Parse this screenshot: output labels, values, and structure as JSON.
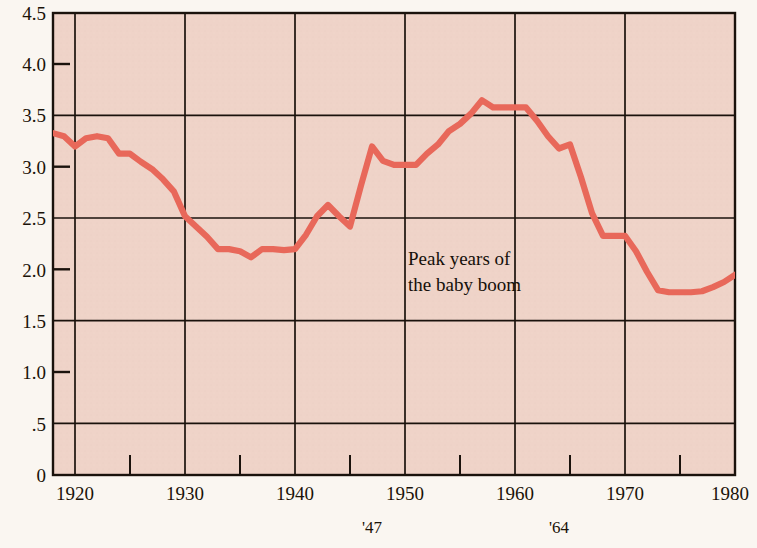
{
  "chart_data": {
    "type": "line",
    "title": "",
    "xlabel": "",
    "ylabel": "",
    "xlim": [
      1918,
      1980
    ],
    "ylim": [
      0,
      4.5
    ],
    "grid": true,
    "legend": null,
    "y_ticks_major": [
      "0",
      ".5",
      "1.0",
      "1.5",
      "2.0",
      "2.5",
      "3.0",
      "3.5",
      "4.0",
      "4.5"
    ],
    "y_tick_values": [
      0,
      0.5,
      1.0,
      1.5,
      2.0,
      2.5,
      3.0,
      3.5,
      4.0,
      4.5
    ],
    "y_gridline_values": [
      0.5,
      1.5,
      2.5,
      3.5,
      4.5
    ],
    "x_ticks_major": [
      "1920",
      "1930",
      "1940",
      "1950",
      "1960",
      "1970",
      "1980"
    ],
    "x_tick_values": [
      1920,
      1930,
      1940,
      1950,
      1960,
      1970,
      1980
    ],
    "x_minor_tick_values": [
      1925,
      1935,
      1945,
      1955,
      1965,
      1975
    ],
    "annotations": [
      {
        "name": "peak-years-note",
        "lines": [
          "Peak years of",
          "the baby boom"
        ],
        "x": 1947.5,
        "y": 2.08
      },
      {
        "name": "x-callout-1947",
        "text": "'47",
        "x": 1947
      },
      {
        "name": "x-callout-1964",
        "text": "'64",
        "x": 1964
      }
    ],
    "series": [
      {
        "name": "Total fertility rate",
        "color": "#e8685a",
        "x": [
          1918,
          1919,
          1920,
          1921,
          1922,
          1923,
          1924,
          1925,
          1926,
          1927,
          1928,
          1929,
          1930,
          1931,
          1932,
          1933,
          1934,
          1935,
          1936,
          1937,
          1938,
          1939,
          1940,
          1941,
          1942,
          1943,
          1944,
          1945,
          1946,
          1947,
          1948,
          1949,
          1950,
          1951,
          1952,
          1953,
          1954,
          1955,
          1956,
          1957,
          1958,
          1959,
          1960,
          1961,
          1962,
          1963,
          1964,
          1965,
          1966,
          1967,
          1968,
          1969,
          1970,
          1971,
          1972,
          1973,
          1974,
          1975,
          1976,
          1977,
          1978,
          1979,
          1980
        ],
        "values": [
          3.33,
          3.3,
          3.2,
          3.28,
          3.3,
          3.28,
          3.13,
          3.13,
          3.05,
          2.98,
          2.88,
          2.76,
          2.52,
          2.42,
          2.32,
          2.2,
          2.2,
          2.18,
          2.12,
          2.2,
          2.2,
          2.19,
          2.2,
          2.34,
          2.52,
          2.63,
          2.52,
          2.42,
          2.82,
          3.2,
          3.06,
          3.02,
          3.02,
          3.02,
          3.13,
          3.22,
          3.35,
          3.42,
          3.52,
          3.65,
          3.58,
          3.58,
          3.58,
          3.58,
          3.45,
          3.3,
          3.18,
          3.22,
          2.9,
          2.55,
          2.33,
          2.33,
          2.33,
          2.18,
          1.98,
          1.8,
          1.78,
          1.78,
          1.78,
          1.79,
          1.83,
          1.88,
          1.95
        ]
      }
    ]
  },
  "style": {
    "plot_background": "#efd3c8",
    "page_background": "#faf6f1",
    "axis_color": "#1a120c",
    "line_color": "#e8685a",
    "text_color": "#1a1208"
  }
}
